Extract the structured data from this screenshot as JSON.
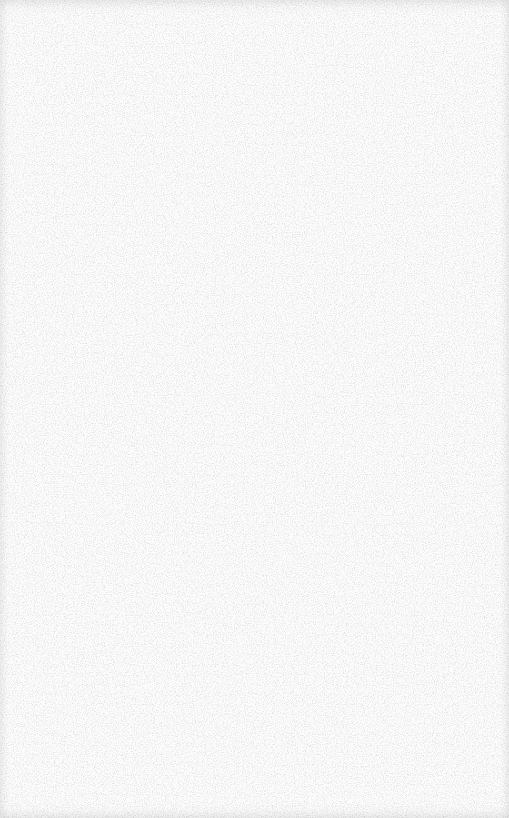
{
  "canvas": {
    "background_color": "#fdfdfd",
    "noise_color": "#c8c8c8",
    "content": "blank textured surface"
  }
}
